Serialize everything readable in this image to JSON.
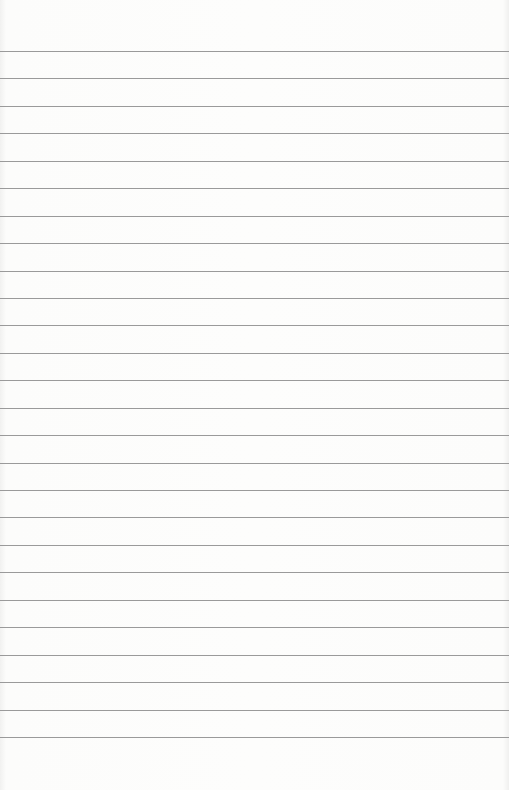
{
  "paper": {
    "type": "lined-paper",
    "background_color": "#fcfcfb",
    "line_color": "#9a9a9a",
    "line_count": 26,
    "first_line_y": 51,
    "line_spacing": 27.44
  }
}
